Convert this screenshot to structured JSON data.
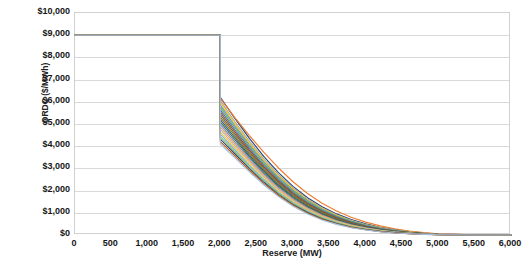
{
  "chart_data": {
    "type": "line",
    "title": "",
    "xlabel": "Reserve (MW)",
    "ylabel": "ORDC ($/MWh)",
    "xlim": [
      0,
      6000
    ],
    "ylim": [
      0,
      10000
    ],
    "xticks": [
      "0",
      "500",
      "1,000",
      "1,500",
      "2,000",
      "2,500",
      "3,000",
      "3,500",
      "4,000",
      "4,500",
      "5,000",
      "5,500",
      "6,000"
    ],
    "xtick_values": [
      0,
      500,
      1000,
      1500,
      2000,
      2500,
      3000,
      3500,
      4000,
      4500,
      5000,
      5500,
      6000
    ],
    "yticks": [
      "$0",
      "$1,000",
      "$2,000",
      "$3,000",
      "$4,000",
      "$5,000",
      "$6,000",
      "$7,000",
      "$8,000",
      "$9,000",
      "$10,000"
    ],
    "ytick_values": [
      0,
      1000,
      2000,
      3000,
      4000,
      5000,
      6000,
      7000,
      8000,
      9000,
      10000
    ],
    "grid": "horizontal",
    "legend": "none",
    "cap_price": 9000,
    "minimum_contingency_level": 2000,
    "x": [
      0,
      2000,
      2000,
      2200,
      2400,
      2600,
      2800,
      3000,
      3200,
      3400,
      3600,
      3800,
      4000,
      4200,
      4400,
      4600,
      4800,
      5000,
      5500,
      6000
    ],
    "series": [
      {
        "name": "Curve 1",
        "color": "#264478",
        "values": [
          9000,
          9000,
          6200,
          5250,
          4350,
          3530,
          2810,
          2190,
          1680,
          1270,
          950,
          700,
          500,
          350,
          240,
          150,
          85,
          40,
          8,
          0
        ]
      },
      {
        "name": "Curve 2",
        "color": "#ED7D31",
        "values": [
          9000,
          9000,
          6150,
          5290,
          4480,
          3720,
          3020,
          2400,
          1870,
          1430,
          1080,
          800,
          580,
          410,
          280,
          180,
          105,
          50,
          10,
          0
        ]
      },
      {
        "name": "Curve 3",
        "color": "#A5A5A5",
        "values": [
          9000,
          9000,
          6050,
          5100,
          4220,
          3420,
          2720,
          2120,
          1620,
          1220,
          910,
          665,
          475,
          330,
          225,
          145,
          80,
          38,
          7,
          0
        ]
      },
      {
        "name": "Curve 4",
        "color": "#FFC000",
        "values": [
          9000,
          9000,
          5950,
          5010,
          4140,
          3350,
          2660,
          2070,
          1580,
          1190,
          885,
          645,
          460,
          320,
          215,
          138,
          76,
          36,
          7,
          0
        ]
      },
      {
        "name": "Curve 5",
        "color": "#5B9BD5",
        "values": [
          9000,
          9000,
          5850,
          4920,
          4060,
          3280,
          2600,
          2020,
          1540,
          1155,
          858,
          624,
          444,
          308,
          207,
          132,
          72,
          34,
          6,
          0
        ]
      },
      {
        "name": "Curve 6",
        "color": "#70AD47",
        "values": [
          9000,
          9000,
          5750,
          4830,
          3980,
          3210,
          2540,
          1970,
          1500,
          1122,
          831,
          602,
          428,
          295,
          198,
          126,
          69,
          32,
          6,
          0
        ]
      },
      {
        "name": "Curve 7",
        "color": "#4472C4",
        "values": [
          9000,
          9000,
          5640,
          4740,
          3900,
          3140,
          2480,
          1920,
          1458,
          1088,
          804,
          581,
          412,
          283,
          190,
          120,
          65,
          30,
          6,
          0
        ]
      },
      {
        "name": "Curve 8",
        "color": "#9E480E",
        "values": [
          9000,
          9000,
          5530,
          4650,
          3820,
          3070,
          2420,
          1870,
          1418,
          1055,
          777,
          560,
          396,
          272,
          182,
          115,
          62,
          29,
          5,
          0
        ]
      },
      {
        "name": "Curve 9",
        "color": "#636363",
        "values": [
          9000,
          9000,
          5420,
          4560,
          3745,
          3005,
          2362,
          1822,
          1378,
          1023,
          751,
          540,
          381,
          261,
          174,
          110,
          59,
          27,
          5,
          0
        ]
      },
      {
        "name": "Curve 10",
        "color": "#997300",
        "values": [
          9000,
          9000,
          5310,
          4470,
          3668,
          2940,
          2305,
          1775,
          1339,
          992,
          726,
          520,
          366,
          250,
          166,
          105,
          56,
          26,
          5,
          0
        ]
      },
      {
        "name": "Curve 11",
        "color": "#255E91",
        "values": [
          9000,
          9000,
          5200,
          4380,
          3590,
          2875,
          2250,
          1728,
          1300,
          961,
          701,
          501,
          352,
          239,
          159,
          100,
          53,
          24,
          4,
          0
        ]
      },
      {
        "name": "Curve 12",
        "color": "#43682B",
        "values": [
          9000,
          9000,
          5090,
          4290,
          3515,
          2810,
          2195,
          1682,
          1262,
          931,
          677,
          482,
          337,
          229,
          151,
          95,
          50,
          23,
          4,
          0
        ]
      },
      {
        "name": "Curve 13",
        "color": "#698ED0",
        "values": [
          9000,
          9000,
          4980,
          4200,
          3440,
          2748,
          2141,
          1637,
          1225,
          901,
          653,
          464,
          324,
          219,
          144,
          90,
          47,
          22,
          4,
          0
        ]
      },
      {
        "name": "Curve 14",
        "color": "#F1975A",
        "values": [
          9000,
          9000,
          4870,
          4110,
          3365,
          2685,
          2088,
          1593,
          1189,
          872,
          630,
          446,
          310,
          209,
          137,
          85,
          45,
          20,
          4,
          0
        ]
      },
      {
        "name": "Curve 15",
        "color": "#B7B7B7",
        "values": [
          9000,
          9000,
          4760,
          4020,
          3290,
          2622,
          2036,
          1549,
          1153,
          843,
          607,
          428,
          297,
          199,
          130,
          81,
          42,
          19,
          3,
          0
        ]
      },
      {
        "name": "Curve 16",
        "color": "#FFCD33",
        "values": [
          9000,
          9000,
          4650,
          3930,
          3215,
          2560,
          1984,
          1506,
          1117,
          815,
          585,
          411,
          284,
          190,
          123,
          76,
          39,
          18,
          3,
          0
        ]
      },
      {
        "name": "Curve 17",
        "color": "#7CAFDD",
        "values": [
          9000,
          9000,
          4540,
          3840,
          3140,
          2498,
          1932,
          1463,
          1082,
          787,
          562,
          394,
          271,
          181,
          117,
          72,
          37,
          17,
          3,
          0
        ]
      },
      {
        "name": "Curve 18",
        "color": "#8CC168",
        "values": [
          9000,
          9000,
          4430,
          3750,
          3065,
          2436,
          1881,
          1421,
          1048,
          759,
          541,
          377,
          259,
          172,
          110,
          68,
          34,
          15,
          3,
          0
        ]
      },
      {
        "name": "Curve 19",
        "color": "#2E4E78",
        "values": [
          9000,
          9000,
          4320,
          3660,
          2990,
          2374,
          1830,
          1379,
          1013,
          732,
          519,
          361,
          247,
          163,
          104,
          64,
          32,
          14,
          2,
          0
        ]
      },
      {
        "name": "Curve 20",
        "color": "#C55A11",
        "values": [
          9000,
          9000,
          4210,
          3570,
          2915,
          2313,
          1779,
          1337,
          980,
          705,
          498,
          345,
          235,
          154,
          98,
          60,
          30,
          13,
          2,
          0
        ]
      },
      {
        "name": "Curve 21",
        "color": "#9DC3E6",
        "values": [
          9000,
          9000,
          4100,
          3480,
          2842,
          2252,
          1729,
          1296,
          946,
          678,
          477,
          329,
          223,
          146,
          92,
          56,
          28,
          12,
          2,
          0
        ]
      }
    ]
  }
}
